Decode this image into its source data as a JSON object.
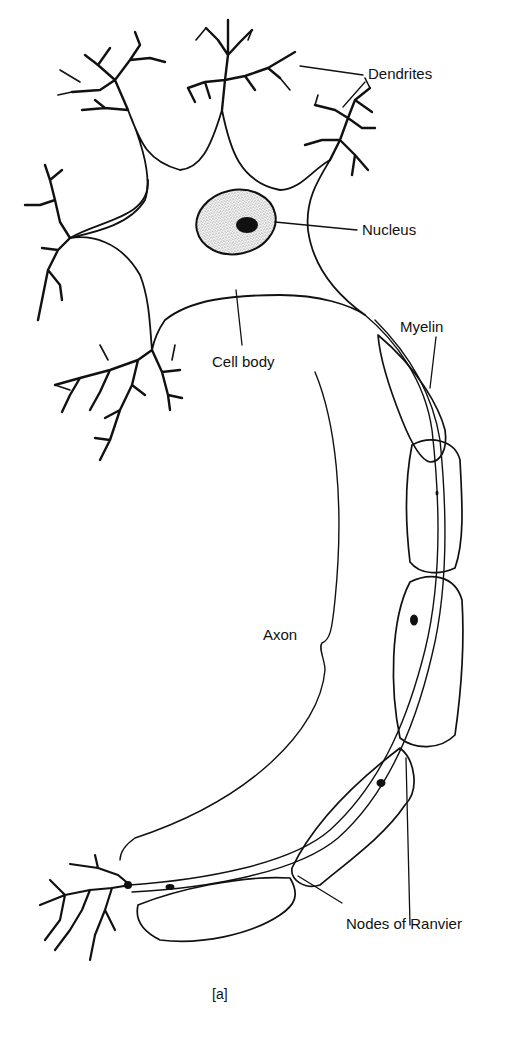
{
  "diagram": {
    "caption": "[a]",
    "labels": {
      "dendrites": "Dendrites",
      "nucleus": "Nucleus",
      "myelin": "Myelin",
      "cell_body": "Cell body",
      "axon": "Axon",
      "nodes_of_ranvier": "Nodes of Ranvier"
    },
    "colors": {
      "ink": "#111111",
      "background": "#ffffff"
    }
  }
}
